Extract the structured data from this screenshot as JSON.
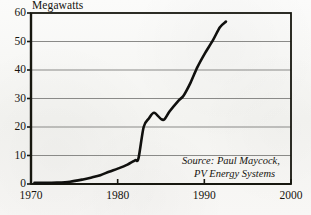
{
  "chart_data": {
    "type": "line",
    "title": "",
    "ylabel": "Megawatts",
    "xlabel": "",
    "xlim": [
      1970,
      2000
    ],
    "ylim": [
      0,
      60
    ],
    "grid": true,
    "legend": false,
    "y_ticks": [
      60,
      50,
      40,
      30,
      20,
      10,
      0
    ],
    "x_ticks": [
      1970,
      1980,
      1990,
      2000
    ],
    "annotations": {
      "source_line_1": "Source: Paul Maycock,",
      "source_line_2": "PV Energy Systems"
    },
    "series": [
      {
        "name": "Megawatts",
        "color": "#10100e",
        "x": [
          1970.4,
          1971.5,
          1973.0,
          1974.5,
          1976.0,
          1977.0,
          1978.0,
          1979.0,
          1980.0,
          1981.0,
          1982.0,
          1982.4,
          1983.0,
          1983.6,
          1984.2,
          1985.0,
          1985.4,
          1986.0,
          1987.0,
          1987.6,
          1988.4,
          1989.2,
          1990.0,
          1991.0,
          1991.8,
          1992.5
        ],
        "values": [
          0.4,
          0.4,
          0.5,
          0.8,
          1.6,
          2.3,
          3.1,
          4.3,
          5.4,
          6.6,
          8.3,
          9.0,
          20.0,
          23.0,
          25.0,
          22.8,
          22.7,
          25.5,
          29.2,
          31.0,
          35.5,
          41.0,
          45.5,
          50.5,
          55.0,
          57.0
        ]
      }
    ]
  },
  "geometry": {
    "plot_left": 31,
    "plot_right": 291,
    "plot_top": 13,
    "plot_bottom": 184,
    "grid_color": "#8a8a88",
    "frame_color": "#17170f"
  }
}
